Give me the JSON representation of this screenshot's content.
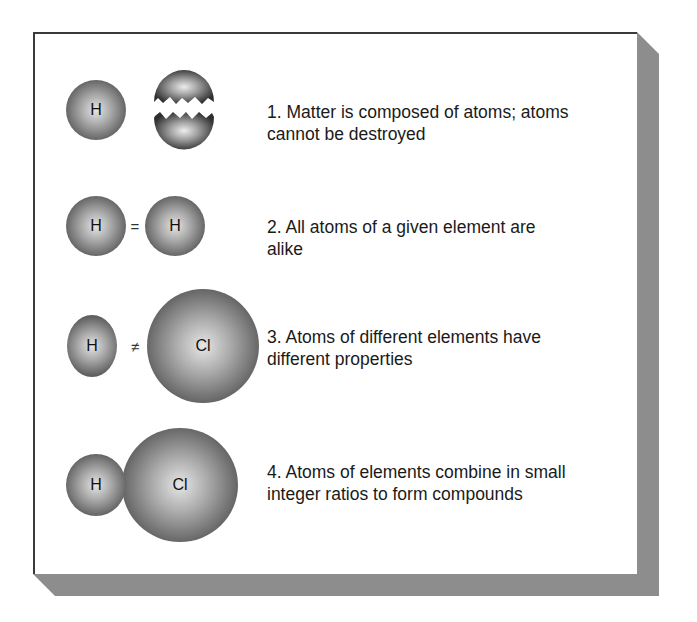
{
  "figure": {
    "principles": [
      {
        "number": "1.",
        "text_line1": "1.  Matter is composed of atoms; atoms",
        "text_line2": "cannot be destroyed",
        "atoms": [
          {
            "symbol": "H"
          },
          {
            "symbol": ""
          }
        ],
        "operator": ""
      },
      {
        "number": "2.",
        "text_line1": "2.  All atoms of a given element are",
        "text_line2": "alike",
        "atoms": [
          {
            "symbol": "H"
          },
          {
            "symbol": "H"
          }
        ],
        "operator": "="
      },
      {
        "number": "3.",
        "text_line1": "3.  Atoms of different elements have",
        "text_line2": "different properties",
        "atoms": [
          {
            "symbol": "H"
          },
          {
            "symbol": "Cl"
          }
        ],
        "operator": "≠"
      },
      {
        "number": "4.",
        "text_line1": "4.  Atoms of elements combine in small",
        "text_line2": "integer ratios to form compounds",
        "atoms": [
          {
            "symbol": "H"
          },
          {
            "symbol": "Cl"
          }
        ],
        "operator": ""
      }
    ],
    "colors": {
      "panel_border": "#3a3a3a",
      "shadow": "#8d8d8d",
      "text": "#1a1a1a"
    }
  }
}
